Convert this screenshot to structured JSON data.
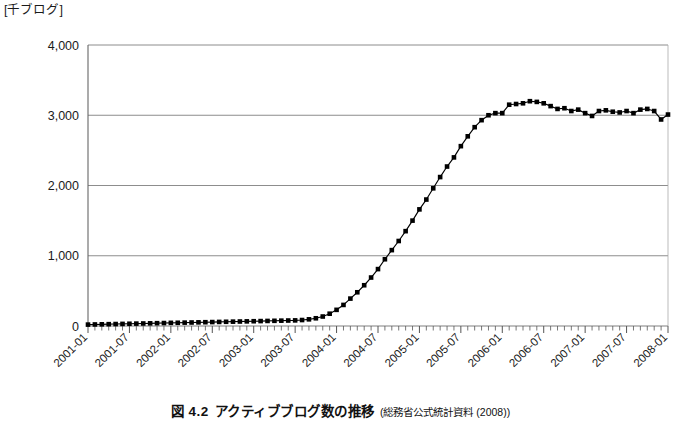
{
  "axis_unit_label": "[千ブログ]",
  "caption": {
    "number": "図 4.2",
    "title": "アクティブブログ数の推移",
    "source": "(総務省公式統計資料 (2008))"
  },
  "chart_data": {
    "type": "line",
    "title": "アクティブブログ数の推移",
    "xlabel": "",
    "ylabel": "千ブログ",
    "ylim": [
      0,
      4000
    ],
    "yticks": [
      0,
      1000,
      2000,
      3000,
      4000
    ],
    "ytick_labels": [
      "0",
      "1,000",
      "2,000",
      "3,000",
      "4,000"
    ],
    "grid": true,
    "legend": "none",
    "marker": "square",
    "marker_color": "#000000",
    "line_color": "#000000",
    "xtick_labels": [
      "2001-01",
      "2001-07",
      "2002-01",
      "2002-07",
      "2003-01",
      "2003-07",
      "2004-01",
      "2004-07",
      "2005-01",
      "2005-07",
      "2006-01",
      "2006-07",
      "2007-01",
      "2007-07",
      "2008-01"
    ],
    "x": [
      "2001-01",
      "2001-02",
      "2001-03",
      "2001-04",
      "2001-05",
      "2001-06",
      "2001-07",
      "2001-08",
      "2001-09",
      "2001-10",
      "2001-11",
      "2001-12",
      "2002-01",
      "2002-02",
      "2002-03",
      "2002-04",
      "2002-05",
      "2002-06",
      "2002-07",
      "2002-08",
      "2002-09",
      "2002-10",
      "2002-11",
      "2002-12",
      "2003-01",
      "2003-02",
      "2003-03",
      "2003-04",
      "2003-05",
      "2003-06",
      "2003-07",
      "2003-08",
      "2003-09",
      "2003-10",
      "2003-11",
      "2003-12",
      "2004-01",
      "2004-02",
      "2004-03",
      "2004-04",
      "2004-05",
      "2004-06",
      "2004-07",
      "2004-08",
      "2004-09",
      "2004-10",
      "2004-11",
      "2004-12",
      "2005-01",
      "2005-02",
      "2005-03",
      "2005-04",
      "2005-05",
      "2005-06",
      "2005-07",
      "2005-08",
      "2005-09",
      "2005-10",
      "2005-11",
      "2005-12",
      "2006-01",
      "2006-02",
      "2006-03",
      "2006-04",
      "2006-05",
      "2006-06",
      "2006-07",
      "2006-08",
      "2006-09",
      "2006-10",
      "2006-11",
      "2006-12",
      "2007-01",
      "2007-02",
      "2007-03",
      "2007-04",
      "2007-05",
      "2007-06",
      "2007-07",
      "2007-08",
      "2007-09",
      "2007-10",
      "2007-11",
      "2007-12",
      "2008-01"
    ],
    "values": [
      20,
      22,
      24,
      26,
      28,
      30,
      32,
      34,
      36,
      38,
      40,
      42,
      45,
      46,
      48,
      50,
      52,
      54,
      56,
      58,
      60,
      62,
      64,
      66,
      68,
      70,
      72,
      74,
      76,
      78,
      80,
      85,
      95,
      110,
      135,
      175,
      230,
      300,
      390,
      480,
      580,
      690,
      810,
      950,
      1080,
      1210,
      1350,
      1500,
      1660,
      1800,
      1960,
      2120,
      2270,
      2400,
      2560,
      2700,
      2830,
      2930,
      3000,
      3030,
      3030,
      3150,
      3160,
      3170,
      3200,
      3190,
      3170,
      3130,
      3090,
      3100,
      3060,
      3080,
      3030,
      2990,
      3060,
      3070,
      3050,
      3040,
      3060,
      3030,
      3080,
      3090,
      3060,
      2940,
      3010
    ]
  }
}
